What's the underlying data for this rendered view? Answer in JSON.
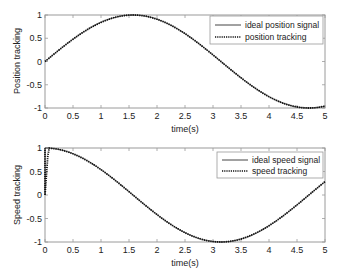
{
  "chart_data": [
    {
      "type": "line",
      "title": "",
      "xlabel": "time(s)",
      "ylabel": "Position tracking",
      "xlim": [
        0,
        5
      ],
      "ylim": [
        -1,
        1
      ],
      "xticks": [
        "0",
        "0.5",
        "1",
        "1.5",
        "2",
        "2.5",
        "3",
        "3.5",
        "4",
        "4.5",
        "5"
      ],
      "yticks": [
        "-1",
        "-0.5",
        "0",
        "0.5",
        "1"
      ],
      "grid": false,
      "legend_position": "upper right",
      "x": [
        0,
        0.5,
        1.0,
        1.5,
        2.0,
        2.5,
        3.0,
        3.5,
        4.0,
        4.5,
        5.0
      ],
      "series": [
        {
          "name": "ideal position signal",
          "style": "solid",
          "function": "sin(t)",
          "values": [
            0,
            0.48,
            0.84,
            1.0,
            0.91,
            0.6,
            0.14,
            -0.35,
            -0.76,
            -0.98,
            -0.96
          ]
        },
        {
          "name": "position tracking",
          "style": "dotted",
          "function": "sin(t)",
          "values": [
            0,
            0.48,
            0.84,
            1.0,
            0.91,
            0.6,
            0.14,
            -0.35,
            -0.76,
            -0.98,
            -0.96
          ]
        }
      ]
    },
    {
      "type": "line",
      "title": "",
      "xlabel": "time(s)",
      "ylabel": "Speed tracking",
      "xlim": [
        0,
        5
      ],
      "ylim": [
        -1,
        1
      ],
      "xticks": [
        "0",
        "0.5",
        "1",
        "1.5",
        "2",
        "2.5",
        "3",
        "3.5",
        "4",
        "4.5",
        "5"
      ],
      "yticks": [
        "-1",
        "-0.5",
        "0",
        "0.5",
        "1"
      ],
      "grid": false,
      "legend_position": "upper right",
      "x": [
        0,
        0.5,
        1.0,
        1.5,
        2.0,
        2.5,
        3.0,
        3.5,
        4.0,
        4.5,
        5.0
      ],
      "series": [
        {
          "name": "ideal speed signal",
          "style": "solid",
          "function": "cos(t)",
          "values": [
            1.0,
            0.88,
            0.54,
            0.07,
            -0.42,
            -0.8,
            -0.99,
            -0.94,
            -0.65,
            -0.21,
            0.28
          ]
        },
        {
          "name": "speed tracking",
          "style": "dotted",
          "function": "cos(t)",
          "values": [
            0.0,
            0.88,
            0.54,
            0.07,
            -0.42,
            -0.8,
            -0.99,
            -0.94,
            -0.65,
            -0.21,
            0.28
          ]
        }
      ]
    }
  ],
  "plots": [
    {
      "ylabel": "Position tracking",
      "xlabel": "time(s)",
      "legend": [
        "ideal position signal",
        "position tracking"
      ]
    },
    {
      "ylabel": "Speed tracking",
      "xlabel": "time(s)",
      "legend": [
        "ideal speed signal",
        "speed tracking"
      ]
    }
  ],
  "colors": {
    "line": "#222222",
    "axis": "#9a9a9a",
    "text": "#222222"
  }
}
